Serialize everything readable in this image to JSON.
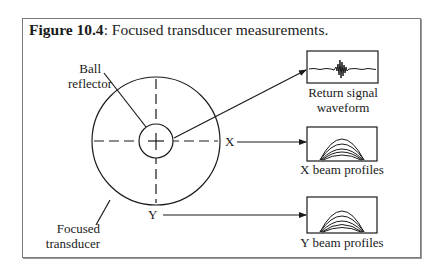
{
  "figure": {
    "number_label": "Figure 10.4",
    "caption_text": ": Focused transducer measurements."
  },
  "diagram": {
    "labels": {
      "ball_line1": "Ball",
      "ball_line2": "reflector",
      "focused_line1": "Focused",
      "focused_line2": "transducer",
      "x_axis": "X",
      "y_axis": "Y",
      "return_line1": "Return signal",
      "return_line2": "waveform",
      "x_profiles": "X beam profiles",
      "y_profiles": "Y beam profiles"
    },
    "components": [
      {
        "name": "Focused transducer",
        "shape": "large circle with dashed crosshair"
      },
      {
        "name": "Ball reflector",
        "shape": "small circle at center"
      },
      {
        "name": "Return signal waveform",
        "shape": "box with pulse trace"
      },
      {
        "name": "X beam profiles",
        "shape": "box with nested bell curves"
      },
      {
        "name": "Y beam profiles",
        "shape": "box with nested bell curves"
      }
    ],
    "connections": [
      {
        "from": "Ball reflector",
        "to": "Return signal waveform",
        "type": "arrow"
      },
      {
        "from": "X",
        "to": "X beam profiles",
        "type": "arrow"
      },
      {
        "from": "Y",
        "to": "Y beam profiles",
        "type": "arrow"
      }
    ]
  }
}
